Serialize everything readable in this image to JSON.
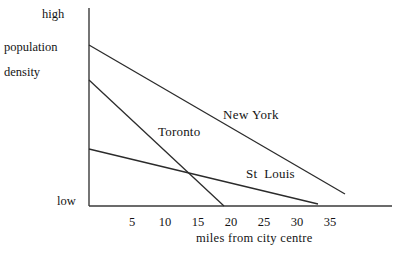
{
  "chart_data": {
    "type": "line",
    "title": "",
    "xlabel": "miles from city centre",
    "ylabel": "population density",
    "ylabel_lines": [
      "population",
      "density"
    ],
    "y_axis_top_label": "high",
    "y_axis_bottom_label": "low",
    "xticks": [
      5,
      10,
      15,
      20,
      25,
      30,
      35
    ],
    "xtick_labels": [
      "5",
      "10",
      "15",
      "20",
      "25",
      "30",
      "35"
    ],
    "xlim": [
      0,
      39
    ],
    "ylim": [
      0,
      100
    ],
    "grid": false,
    "legend_position": "inline-annotations",
    "series": [
      {
        "name": "New York",
        "label": "New York",
        "x": [
          0,
          33
        ],
        "values": [
          81,
          6
        ]
      },
      {
        "name": "Toronto",
        "label": "Toronto",
        "x": [
          0,
          17.5
        ],
        "values": [
          64,
          0
        ]
      },
      {
        "name": "St Louis",
        "label": "St  Louis",
        "x": [
          0,
          30.3
        ],
        "values": [
          29,
          1
        ]
      }
    ],
    "annotations": [
      {
        "text": "New York",
        "x": 20.3,
        "y": 47
      },
      {
        "text": "Toronto",
        "x": 10.5,
        "y": 39
      },
      {
        "text": "St  Louis",
        "x": 23.8,
        "y": 18
      }
    ],
    "colors": {
      "axis": "#3a3a3a",
      "line": "#2b2b2b",
      "background": "#ffffff",
      "text": "#141414"
    }
  },
  "axes": {
    "high_label": "high",
    "low_label": "low",
    "y_title_line1": "population",
    "y_title_line2": "density",
    "x_title": "miles from city centre"
  },
  "ticks": {
    "labels": [
      "5",
      "10",
      "15",
      "20",
      "25",
      "30",
      "35"
    ],
    "positions_px": [
      132,
      165,
      198,
      231,
      264,
      297,
      330
    ]
  },
  "series_labels": {
    "new_york": "New York",
    "toronto": "Toronto",
    "st_louis": "St  Louis"
  }
}
